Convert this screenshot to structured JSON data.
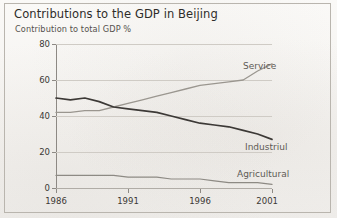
{
  "chart_data": {
    "type": "line",
    "title": "Contributions to the GDP in Beijing",
    "subtitle": "Contribution to total GDP %",
    "xlabel": "",
    "ylabel": "Contribution to total GDP %",
    "xlim": [
      1986,
      2001
    ],
    "ylim": [
      0,
      80
    ],
    "yticks": [
      0,
      20,
      40,
      60,
      80
    ],
    "xticks": [
      1986,
      1991,
      1996,
      2001
    ],
    "ytick_labels": [
      "0",
      "20",
      "40",
      "60",
      "80"
    ],
    "xtick_labels": [
      "1986",
      "1991",
      "1996",
      "2001"
    ],
    "grid": true,
    "legend_position": "inline-labels",
    "x": [
      1986,
      1987,
      1988,
      1989,
      1990,
      1991,
      1992,
      1993,
      1994,
      1995,
      1996,
      1997,
      1998,
      1999,
      2000,
      2001
    ],
    "series": [
      {
        "name": "Service",
        "color": "#9a968f",
        "values": [
          42,
          42,
          43,
          43,
          45,
          47,
          49,
          51,
          53,
          55,
          57,
          58,
          59,
          60,
          65,
          69
        ]
      },
      {
        "name": "Industrial",
        "color": "#3c3936",
        "values": [
          50,
          49,
          50,
          48,
          45,
          44,
          43,
          42,
          40,
          38,
          36,
          35,
          34,
          32,
          30,
          27
        ]
      },
      {
        "name": "Agricultural",
        "color": "#8d8a84",
        "values": [
          7,
          7,
          7,
          7,
          7,
          6,
          6,
          6,
          5,
          5,
          5,
          4,
          3,
          3,
          3,
          2
        ]
      }
    ],
    "annotations": [
      {
        "text": "Service",
        "series": "Service"
      },
      {
        "text": "Industriul",
        "series": "Industrial"
      },
      {
        "text": "Agricultural",
        "series": "Agricultural"
      }
    ]
  },
  "labels": {
    "service": "Service",
    "industrial": "Industriul",
    "agricultural": "Agricultural"
  }
}
